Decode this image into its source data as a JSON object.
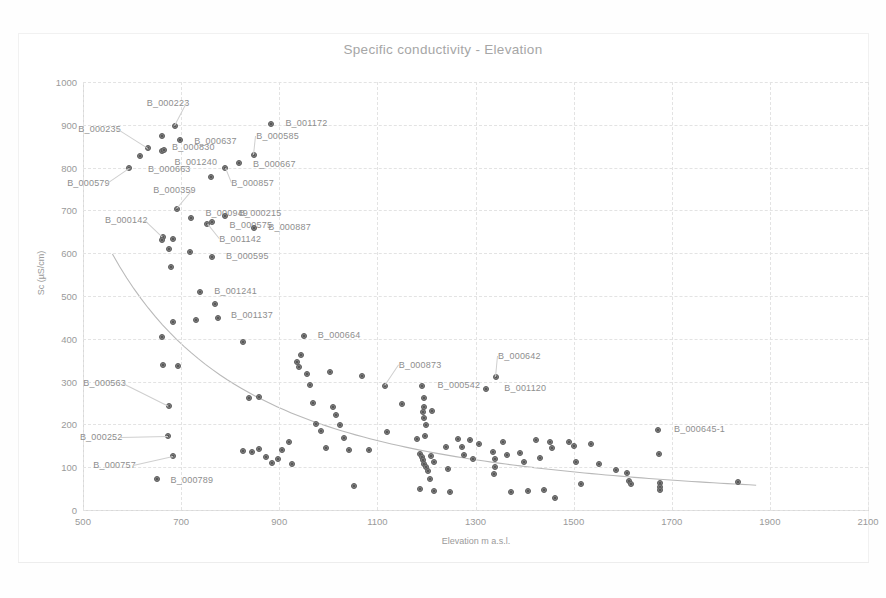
{
  "chart_data": {
    "type": "scatter",
    "title": "Specific conductivity - Elevation",
    "xlabel": "Elevation m a.s.l.",
    "ylabel": "Sc (µS/cm)",
    "xlim": [
      500,
      2100
    ],
    "ylim": [
      0,
      1000
    ],
    "xticks": [
      500,
      700,
      900,
      1100,
      1300,
      1500,
      1700,
      1900,
      2100
    ],
    "yticks": [
      0,
      100,
      200,
      300,
      400,
      500,
      600,
      700,
      800,
      900,
      1000
    ],
    "grid": true,
    "legend": "none",
    "marker_color": "#7f7f7f",
    "trendline": {
      "type": "power-decay",
      "color": "#b5b5b5",
      "x_start": 560,
      "y_start": 598,
      "x_end": 1872,
      "y_end": 58
    },
    "points": [
      {
        "x": 594,
        "y": 800,
        "label": "B_000579",
        "lx": -62,
        "ly": 16
      },
      {
        "x": 616,
        "y": 827,
        "label": "B_000663",
        "lx": 8,
        "ly": 14
      },
      {
        "x": 633,
        "y": 845,
        "label": "B_000235",
        "lx": -70,
        "ly": -18
      },
      {
        "x": 660,
        "y": 875,
        "label": "",
        "lx": 0,
        "ly": 0
      },
      {
        "x": 662,
        "y": 838,
        "label": "B_001240",
        "lx": 12,
        "ly": 12
      },
      {
        "x": 665,
        "y": 840,
        "label": "B_000830",
        "lx": 8,
        "ly": -2
      },
      {
        "x": 687,
        "y": 898,
        "label": "B_000223",
        "lx": -28,
        "ly": -22
      },
      {
        "x": 698,
        "y": 864,
        "label": "B_000637",
        "lx": 14,
        "ly": 2
      },
      {
        "x": 760,
        "y": 778,
        "label": "",
        "lx": 0,
        "ly": 0
      },
      {
        "x": 790,
        "y": 800,
        "label": "B_000857",
        "lx": 6,
        "ly": 16
      },
      {
        "x": 818,
        "y": 810,
        "label": "B_000667",
        "lx": 14,
        "ly": 2
      },
      {
        "x": 849,
        "y": 830,
        "label": "B_000585",
        "lx": 2,
        "ly": -18
      },
      {
        "x": 884,
        "y": 903,
        "label": "B_001172",
        "lx": 14,
        "ly": 0
      },
      {
        "x": 692,
        "y": 703,
        "label": "B_000359",
        "lx": -24,
        "ly": -18
      },
      {
        "x": 721,
        "y": 683,
        "label": "B_000949",
        "lx": 14,
        "ly": -4
      },
      {
        "x": 753,
        "y": 668,
        "label": "B_001142",
        "lx": 12,
        "ly": 16
      },
      {
        "x": 762,
        "y": 672,
        "label": "B_000575",
        "lx": 18,
        "ly": 4
      },
      {
        "x": 789,
        "y": 688,
        "label": "B_000215",
        "lx": 14,
        "ly": -2
      },
      {
        "x": 849,
        "y": 659,
        "label": "B_000887",
        "lx": 14,
        "ly": 0
      },
      {
        "x": 663,
        "y": 637,
        "label": "B_000142",
        "lx": -58,
        "ly": -16
      },
      {
        "x": 662,
        "y": 631,
        "label": "",
        "lx": 0,
        "ly": 0
      },
      {
        "x": 684,
        "y": 634,
        "label": "",
        "lx": 0,
        "ly": 0
      },
      {
        "x": 676,
        "y": 610,
        "label": "",
        "lx": 0,
        "ly": 0
      },
      {
        "x": 680,
        "y": 567,
        "label": "",
        "lx": 0,
        "ly": 0
      },
      {
        "x": 718,
        "y": 603,
        "label": "",
        "lx": 0,
        "ly": 0
      },
      {
        "x": 763,
        "y": 592,
        "label": "B_000595",
        "lx": 14,
        "ly": 0
      },
      {
        "x": 739,
        "y": 509,
        "label": "B_001241",
        "lx": 14,
        "ly": 0
      },
      {
        "x": 769,
        "y": 481,
        "label": "B_001137",
        "lx": 16,
        "ly": 12
      },
      {
        "x": 776,
        "y": 448,
        "label": "",
        "lx": 0,
        "ly": 0
      },
      {
        "x": 730,
        "y": 445,
        "label": "",
        "lx": 0,
        "ly": 0
      },
      {
        "x": 660,
        "y": 404,
        "label": "",
        "lx": 0,
        "ly": 0
      },
      {
        "x": 684,
        "y": 440,
        "label": "",
        "lx": 0,
        "ly": 0
      },
      {
        "x": 664,
        "y": 339,
        "label": "",
        "lx": 0,
        "ly": 0
      },
      {
        "x": 694,
        "y": 337,
        "label": "",
        "lx": 0,
        "ly": 0
      },
      {
        "x": 676,
        "y": 243,
        "label": "B_000563",
        "lx": -86,
        "ly": -22
      },
      {
        "x": 673,
        "y": 172,
        "label": "B_000252",
        "lx": -88,
        "ly": 2
      },
      {
        "x": 684,
        "y": 126,
        "label": "B_000757",
        "lx": -80,
        "ly": 10
      },
      {
        "x": 650,
        "y": 72,
        "label": "B_000789",
        "lx": 14,
        "ly": 2
      },
      {
        "x": 826,
        "y": 392,
        "label": "",
        "lx": 0,
        "ly": 0
      },
      {
        "x": 838,
        "y": 261,
        "label": "",
        "lx": 0,
        "ly": 0
      },
      {
        "x": 858,
        "y": 263,
        "label": "",
        "lx": 0,
        "ly": 0
      },
      {
        "x": 826,
        "y": 137,
        "label": "",
        "lx": 0,
        "ly": 0
      },
      {
        "x": 844,
        "y": 135,
        "label": "",
        "lx": 0,
        "ly": 0
      },
      {
        "x": 858,
        "y": 143,
        "label": "",
        "lx": 0,
        "ly": 0
      },
      {
        "x": 872,
        "y": 125,
        "label": "",
        "lx": 0,
        "ly": 0
      },
      {
        "x": 886,
        "y": 109,
        "label": "",
        "lx": 0,
        "ly": 0
      },
      {
        "x": 898,
        "y": 118,
        "label": "",
        "lx": 0,
        "ly": 0
      },
      {
        "x": 905,
        "y": 140,
        "label": "",
        "lx": 0,
        "ly": 0
      },
      {
        "x": 919,
        "y": 158,
        "label": "",
        "lx": 0,
        "ly": 0
      },
      {
        "x": 926,
        "y": 107,
        "label": "",
        "lx": 0,
        "ly": 0
      },
      {
        "x": 936,
        "y": 345,
        "label": "",
        "lx": 0,
        "ly": 0
      },
      {
        "x": 940,
        "y": 333,
        "label": "",
        "lx": 0,
        "ly": 0
      },
      {
        "x": 944,
        "y": 363,
        "label": "",
        "lx": 0,
        "ly": 0
      },
      {
        "x": 950,
        "y": 406,
        "label": "B_000664",
        "lx": 14,
        "ly": 0
      },
      {
        "x": 957,
        "y": 317,
        "label": "",
        "lx": 0,
        "ly": 0
      },
      {
        "x": 963,
        "y": 291,
        "label": "",
        "lx": 0,
        "ly": 0
      },
      {
        "x": 968,
        "y": 250,
        "label": "",
        "lx": 0,
        "ly": 0
      },
      {
        "x": 975,
        "y": 200,
        "label": "",
        "lx": 0,
        "ly": 0
      },
      {
        "x": 985,
        "y": 185,
        "label": "",
        "lx": 0,
        "ly": 0
      },
      {
        "x": 996,
        "y": 145,
        "label": "",
        "lx": 0,
        "ly": 0
      },
      {
        "x": 1004,
        "y": 322,
        "label": "",
        "lx": 0,
        "ly": 0
      },
      {
        "x": 1010,
        "y": 240,
        "label": "",
        "lx": 0,
        "ly": 0
      },
      {
        "x": 1016,
        "y": 222,
        "label": "",
        "lx": 0,
        "ly": 0
      },
      {
        "x": 1024,
        "y": 198,
        "label": "",
        "lx": 0,
        "ly": 0
      },
      {
        "x": 1032,
        "y": 168,
        "label": "",
        "lx": 0,
        "ly": 0
      },
      {
        "x": 1042,
        "y": 140,
        "label": "",
        "lx": 0,
        "ly": 0
      },
      {
        "x": 1052,
        "y": 55,
        "label": "",
        "lx": 0,
        "ly": 0
      },
      {
        "x": 1068,
        "y": 314,
        "label": "",
        "lx": 0,
        "ly": 0
      },
      {
        "x": 1082,
        "y": 140,
        "label": "",
        "lx": 0,
        "ly": 0
      },
      {
        "x": 1115,
        "y": 290,
        "label": "B_000873",
        "lx": 14,
        "ly": -20
      },
      {
        "x": 1120,
        "y": 182,
        "label": "",
        "lx": 0,
        "ly": 0
      },
      {
        "x": 1150,
        "y": 248,
        "label": "",
        "lx": 0,
        "ly": 0
      },
      {
        "x": 1190,
        "y": 290,
        "label": "B_000542",
        "lx": 16,
        "ly": 0
      },
      {
        "x": 1196,
        "y": 262,
        "label": "",
        "lx": 0,
        "ly": 0
      },
      {
        "x": 1196,
        "y": 241,
        "label": "",
        "lx": 0,
        "ly": 0
      },
      {
        "x": 1194,
        "y": 228,
        "label": "",
        "lx": 0,
        "ly": 0
      },
      {
        "x": 1196,
        "y": 214,
        "label": "",
        "lx": 0,
        "ly": 0
      },
      {
        "x": 1200,
        "y": 198,
        "label": "",
        "lx": 0,
        "ly": 0
      },
      {
        "x": 1212,
        "y": 232,
        "label": "",
        "lx": 0,
        "ly": 0
      },
      {
        "x": 1197,
        "y": 174,
        "label": "",
        "lx": 0,
        "ly": 0
      },
      {
        "x": 1180,
        "y": 165,
        "label": "",
        "lx": 0,
        "ly": 0
      },
      {
        "x": 1186,
        "y": 132,
        "label": "",
        "lx": 0,
        "ly": 0
      },
      {
        "x": 1190,
        "y": 124,
        "label": "",
        "lx": 0,
        "ly": 0
      },
      {
        "x": 1192,
        "y": 116,
        "label": "",
        "lx": 0,
        "ly": 0
      },
      {
        "x": 1196,
        "y": 108,
        "label": "",
        "lx": 0,
        "ly": 0
      },
      {
        "x": 1200,
        "y": 100,
        "label": "",
        "lx": 0,
        "ly": 0
      },
      {
        "x": 1204,
        "y": 92,
        "label": "",
        "lx": 0,
        "ly": 0
      },
      {
        "x": 1210,
        "y": 127,
        "label": "",
        "lx": 0,
        "ly": 0
      },
      {
        "x": 1216,
        "y": 112,
        "label": "",
        "lx": 0,
        "ly": 0
      },
      {
        "x": 1208,
        "y": 72,
        "label": "",
        "lx": 0,
        "ly": 0
      },
      {
        "x": 1186,
        "y": 48,
        "label": "",
        "lx": 0,
        "ly": 0
      },
      {
        "x": 1216,
        "y": 45,
        "label": "",
        "lx": 0,
        "ly": 0
      },
      {
        "x": 1240,
        "y": 147,
        "label": "",
        "lx": 0,
        "ly": 0
      },
      {
        "x": 1244,
        "y": 96,
        "label": "",
        "lx": 0,
        "ly": 0
      },
      {
        "x": 1248,
        "y": 42,
        "label": "",
        "lx": 0,
        "ly": 0
      },
      {
        "x": 1264,
        "y": 165,
        "label": "",
        "lx": 0,
        "ly": 0
      },
      {
        "x": 1272,
        "y": 147,
        "label": "",
        "lx": 0,
        "ly": 0
      },
      {
        "x": 1276,
        "y": 128,
        "label": "",
        "lx": 0,
        "ly": 0
      },
      {
        "x": 1288,
        "y": 163,
        "label": "",
        "lx": 0,
        "ly": 0
      },
      {
        "x": 1294,
        "y": 120,
        "label": "",
        "lx": 0,
        "ly": 0
      },
      {
        "x": 1308,
        "y": 155,
        "label": "",
        "lx": 0,
        "ly": 0
      },
      {
        "x": 1322,
        "y": 283,
        "label": "B_001120",
        "lx": 18,
        "ly": 0
      },
      {
        "x": 1342,
        "y": 310,
        "label": "B_000642",
        "lx": 2,
        "ly": -20
      },
      {
        "x": 1336,
        "y": 136,
        "label": "",
        "lx": 0,
        "ly": 0
      },
      {
        "x": 1340,
        "y": 118,
        "label": "",
        "lx": 0,
        "ly": 0
      },
      {
        "x": 1340,
        "y": 100,
        "label": "",
        "lx": 0,
        "ly": 0
      },
      {
        "x": 1338,
        "y": 84,
        "label": "",
        "lx": 0,
        "ly": 0
      },
      {
        "x": 1356,
        "y": 158,
        "label": "",
        "lx": 0,
        "ly": 0
      },
      {
        "x": 1364,
        "y": 128,
        "label": "",
        "lx": 0,
        "ly": 0
      },
      {
        "x": 1372,
        "y": 43,
        "label": "",
        "lx": 0,
        "ly": 0
      },
      {
        "x": 1390,
        "y": 134,
        "label": "",
        "lx": 0,
        "ly": 0
      },
      {
        "x": 1398,
        "y": 112,
        "label": "",
        "lx": 0,
        "ly": 0
      },
      {
        "x": 1408,
        "y": 44,
        "label": "",
        "lx": 0,
        "ly": 0
      },
      {
        "x": 1424,
        "y": 164,
        "label": "",
        "lx": 0,
        "ly": 0
      },
      {
        "x": 1432,
        "y": 121,
        "label": "",
        "lx": 0,
        "ly": 0
      },
      {
        "x": 1440,
        "y": 46,
        "label": "",
        "lx": 0,
        "ly": 0
      },
      {
        "x": 1452,
        "y": 158,
        "label": "",
        "lx": 0,
        "ly": 0
      },
      {
        "x": 1456,
        "y": 145,
        "label": "",
        "lx": 0,
        "ly": 0
      },
      {
        "x": 1462,
        "y": 28,
        "label": "",
        "lx": 0,
        "ly": 0
      },
      {
        "x": 1490,
        "y": 160,
        "label": "",
        "lx": 0,
        "ly": 0
      },
      {
        "x": 1500,
        "y": 150,
        "label": "",
        "lx": 0,
        "ly": 0
      },
      {
        "x": 1504,
        "y": 112,
        "label": "",
        "lx": 0,
        "ly": 0
      },
      {
        "x": 1516,
        "y": 60,
        "label": "",
        "lx": 0,
        "ly": 0
      },
      {
        "x": 1536,
        "y": 155,
        "label": "",
        "lx": 0,
        "ly": 0
      },
      {
        "x": 1552,
        "y": 108,
        "label": "",
        "lx": 0,
        "ly": 0
      },
      {
        "x": 1586,
        "y": 94,
        "label": "",
        "lx": 0,
        "ly": 0
      },
      {
        "x": 1608,
        "y": 86,
        "label": "",
        "lx": 0,
        "ly": 0
      },
      {
        "x": 1612,
        "y": 68,
        "label": "",
        "lx": 0,
        "ly": 0
      },
      {
        "x": 1616,
        "y": 60,
        "label": "",
        "lx": 0,
        "ly": 0
      },
      {
        "x": 1672,
        "y": 188,
        "label": "B_000645-1",
        "lx": 16,
        "ly": 0
      },
      {
        "x": 1674,
        "y": 131,
        "label": "",
        "lx": 0,
        "ly": 0
      },
      {
        "x": 1676,
        "y": 63,
        "label": "",
        "lx": 0,
        "ly": 0
      },
      {
        "x": 1676,
        "y": 54,
        "label": "",
        "lx": 0,
        "ly": 0
      },
      {
        "x": 1676,
        "y": 46,
        "label": "",
        "lx": 0,
        "ly": 0
      },
      {
        "x": 1836,
        "y": 66,
        "label": "",
        "lx": 0,
        "ly": 0
      }
    ]
  }
}
